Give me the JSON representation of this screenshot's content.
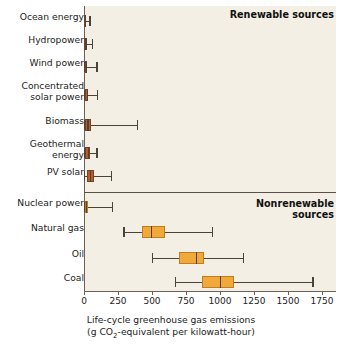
{
  "chart_data": {
    "type": "bar",
    "subtype": "box-and-whisker",
    "title": "",
    "xlabel_line1": "Life-cycle greenhouse gas emissions",
    "xlabel_line2": "(g CO2-equivalent per kilowatt-hour)",
    "ylabel": "",
    "xlim": [
      0,
      1750
    ],
    "xticks": [
      0,
      250,
      500,
      750,
      1000,
      1250,
      1500,
      1750
    ],
    "xticklabels": [
      "0",
      "250",
      "500",
      "750",
      "1000",
      "1250",
      "1500",
      "1750"
    ],
    "grid": false,
    "legend": "none",
    "groups": [
      {
        "name": "Renewable sources",
        "label_align": "right",
        "color": "#b5491f",
        "fill": "#b95a2a",
        "categories": [
          {
            "label": "Ocean energy",
            "min": 0,
            "q1": 2,
            "median": 8,
            "q3": 14,
            "max": 40
          },
          {
            "label": "Hydropower",
            "min": 0,
            "q1": 3,
            "median": 10,
            "q3": 16,
            "max": 60
          },
          {
            "label": "Wind power",
            "min": 0,
            "q1": 7,
            "median": 14,
            "q3": 25,
            "max": 90
          },
          {
            "label": "Concentrated\nsolar power",
            "min": 0,
            "q1": 8,
            "median": 20,
            "q3": 32,
            "max": 95
          },
          {
            "label": "Biomass",
            "min": 0,
            "q1": 10,
            "median": 25,
            "q3": 55,
            "max": 390
          },
          {
            "label": "Geothermal\nenergy",
            "min": 0,
            "q1": 10,
            "median": 30,
            "q3": 45,
            "max": 90
          },
          {
            "label": "PV solar",
            "min": 0,
            "q1": 20,
            "median": 45,
            "q3": 70,
            "max": 200
          }
        ]
      },
      {
        "name": "Nonrenewable\nsources",
        "label_align": "right",
        "color": "#e8911f",
        "fill": "#f2a93c",
        "categories": [
          {
            "label": "Nuclear power",
            "min": 0,
            "q1": 5,
            "median": 15,
            "q3": 30,
            "max": 205
          },
          {
            "label": "Natural gas",
            "min": 290,
            "q1": 430,
            "median": 490,
            "q3": 595,
            "max": 940
          },
          {
            "label": "Oil",
            "min": 500,
            "q1": 700,
            "median": 820,
            "q3": 885,
            "max": 1170
          },
          {
            "label": "Coal",
            "min": 670,
            "q1": 865,
            "median": 1000,
            "q3": 1105,
            "max": 1680
          }
        ]
      }
    ]
  },
  "colors": {
    "plot_background": "#f3efe4",
    "renewable_fill": "#b95a2a",
    "renewable_stroke": "#7a4223",
    "nonrenewable_fill": "#f2a93c",
    "nonrenewable_stroke": "#c27d1c",
    "axis": "#6b6154",
    "text": "#1c1c1c"
  }
}
